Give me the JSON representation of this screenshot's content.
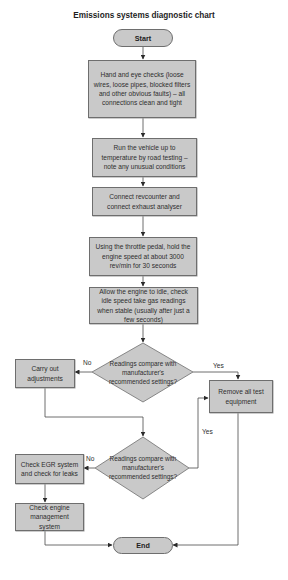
{
  "chart_title": "Emissions systems diagnostic chart",
  "nodes": {
    "start": "Start",
    "step1": "Hand and eye checks (loose wires, loose pipes, blocked filters and other obvious faults) – all connections clean and tight",
    "step2": "Run the vehicle up to temperature by road testing – note any unusual conditions",
    "step3": "Connect revcounter and connect exhaust analyser",
    "step4": "Using the throttle pedal, hold the engine speed at about 3000 rev/min for 30 seconds",
    "step5": "Allow the engine to idle, check idle speed take gas readings when stable (usually after just a few seconds)",
    "decision1": "Readings compare with manufacturer's recommended settings?",
    "adjust": "Carry out adjustments",
    "remove": "Remove all test equipment",
    "decision2": "Readings compare with manufacturer's recommended settings?",
    "egr": "Check EGR system and check for leaks",
    "ems": "Check engine management system",
    "end": "End"
  },
  "edge_labels": {
    "d1_no": "No",
    "d1_yes": "Yes",
    "d2_no": "No",
    "d2_yes": "Yes"
  },
  "colors": {
    "fill": "#c9c9c9",
    "stroke": "#6e6e6e",
    "line": "#3a3a3a"
  }
}
